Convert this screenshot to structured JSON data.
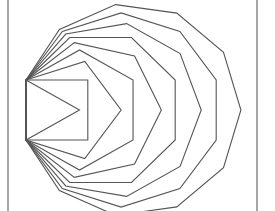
{
  "figure": {
    "frame": {
      "left_x": 8,
      "right_x": 257,
      "color": "#6a6a6a"
    },
    "shared_edge": {
      "x": 26,
      "y_top": 80,
      "y_bottom": 140
    },
    "horizontal_scale": 1.03,
    "stroke_color": "#555555",
    "polygons": [
      {
        "name": "triangle",
        "sides": 3
      },
      {
        "name": "square",
        "sides": 4
      },
      {
        "name": "pentagon",
        "sides": 5
      },
      {
        "name": "hexagon",
        "sides": 6
      },
      {
        "name": "heptagon",
        "sides": 7
      },
      {
        "name": "octagon",
        "sides": 8
      },
      {
        "name": "nonagon",
        "sides": 9
      },
      {
        "name": "decagon",
        "sides": 10
      },
      {
        "name": "hendecagon",
        "sides": 11
      }
    ]
  }
}
